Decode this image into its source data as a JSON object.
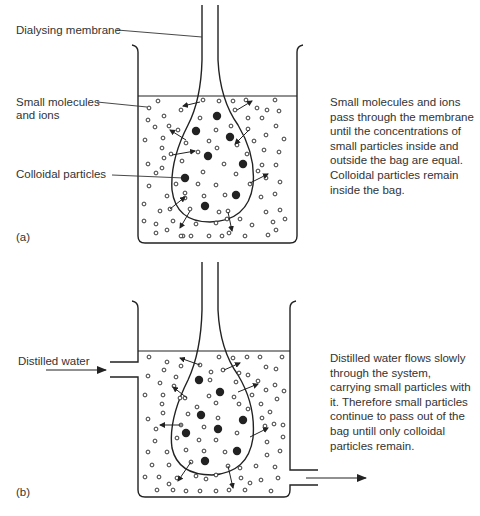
{
  "panel_a": {
    "tag": "(a)",
    "labels": {
      "membrane": "Dialysing membrane",
      "small_line1": "Small molecules",
      "small_line2": "and ions",
      "colloidal": "Colloidal particles"
    },
    "description_lines": [
      "Small molecules and ions",
      "pass through the membrane",
      "until the concentrations of",
      "small particles inside and",
      "outside the bag are equal.",
      "Colloidal particles remain",
      "inside the bag."
    ]
  },
  "panel_b": {
    "tag": "(b)",
    "labels": {
      "inlet": "Distilled water"
    },
    "description_lines": [
      "Distilled water flows slowly",
      "through the system,",
      "carrying small particles with",
      "it. Therefore small particles",
      "continue to pass out of the",
      "bag untill only colloidal",
      "particles remain."
    ]
  },
  "legend": {
    "small_particle": "open circle",
    "colloidal_particle": "filled circle"
  },
  "colors": {
    "ink": "#222222",
    "text": "#333333",
    "background": "#ffffff"
  }
}
